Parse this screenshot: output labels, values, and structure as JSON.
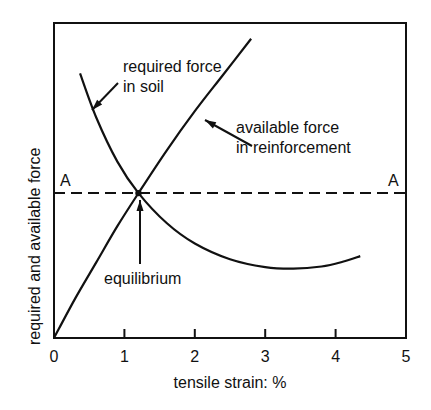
{
  "chart_data": {
    "type": "line",
    "title": "",
    "xlabel": "tensile strain: %",
    "ylabel": "required and available force",
    "xlim": [
      0,
      5
    ],
    "ylim": [
      0,
      100
    ],
    "x_ticks": [
      "0",
      "1",
      "2",
      "3",
      "4",
      "5"
    ],
    "y_ticks": [],
    "grid": false,
    "legend": "none (curves labelled directly with arrows)",
    "series": [
      {
        "name": "required force in soil",
        "label_lines": [
          "required force",
          "in soil"
        ],
        "points": [
          [
            0.37,
            84
          ],
          [
            0.6,
            70
          ],
          [
            0.9,
            56
          ],
          [
            1.2,
            46
          ],
          [
            1.6,
            36.5
          ],
          [
            2.0,
            30
          ],
          [
            2.5,
            25
          ],
          [
            3.0,
            22.5
          ],
          [
            3.4,
            22
          ],
          [
            3.8,
            22.7
          ],
          [
            4.1,
            24.2
          ],
          [
            4.35,
            26
          ]
        ]
      },
      {
        "name": "available force in reinforcement",
        "label_lines": [
          "available force",
          "in reinforcement"
        ],
        "points": [
          [
            0.0,
            0
          ],
          [
            0.3,
            12.5
          ],
          [
            0.6,
            24
          ],
          [
            0.9,
            35.5
          ],
          [
            1.2,
            46
          ],
          [
            1.6,
            59.5
          ],
          [
            2.0,
            72
          ],
          [
            2.4,
            83.5
          ],
          [
            2.8,
            95
          ]
        ]
      },
      {
        "name": "A–A",
        "style": "dashed",
        "points": [
          [
            0,
            46
          ],
          [
            5,
            46
          ]
        ],
        "end_labels": [
          "A",
          "A"
        ]
      }
    ],
    "annotations": [
      {
        "text": "equilibrium",
        "points_to": [
          1.2,
          46
        ]
      }
    ]
  }
}
